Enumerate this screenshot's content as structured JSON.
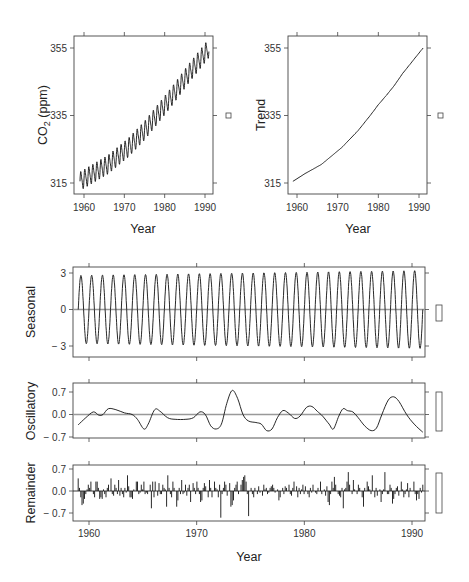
{
  "chart_data": [
    {
      "id": "co2",
      "type": "line",
      "title": "",
      "xlabel": "Year",
      "ylabel": "CO2 (ppm)",
      "ylabel_main": "CO",
      "ylabel_sub": "2",
      "ylabel_rest": " (ppm)",
      "xlim": [
        1958.5,
        1992
      ],
      "ylim": [
        313,
        358
      ],
      "xticks": [
        1960,
        1970,
        1980,
        1990
      ],
      "xtick_labels": [
        "1960",
        "1970",
        "1980",
        "1990"
      ],
      "yticks": [
        315,
        335,
        355
      ],
      "ytick_labels": [
        "315",
        "335",
        "355"
      ],
      "grid": false,
      "series": [
        {
          "name": "Monthly CO2",
          "x_start": 1959.0,
          "x_end": 1991.0,
          "seasonal_amplitude": 3.0,
          "trend_points": [
            [
              1959,
              315.5
            ],
            [
              1966,
              320.5
            ],
            [
              1971,
              325.5
            ],
            [
              1975,
              330.5
            ],
            [
              1978,
              335
            ],
            [
              1982,
              341
            ],
            [
              1986,
              347.5
            ],
            [
              1991,
              355
            ]
          ]
        }
      ],
      "range_box": {
        "label": "square marker",
        "value_span": 0
      }
    },
    {
      "id": "trend",
      "type": "line",
      "xlabel": "Year",
      "ylabel": "Trend",
      "xlim": [
        1958.5,
        1992
      ],
      "ylim": [
        313,
        358
      ],
      "xticks": [
        1960,
        1970,
        1980,
        1990
      ],
      "xtick_labels": [
        "1960",
        "1970",
        "1980",
        "1990"
      ],
      "yticks": [
        315,
        335,
        355
      ],
      "ytick_labels": [
        "315",
        "335",
        "355"
      ],
      "grid": false,
      "series": [
        {
          "name": "Trend",
          "points": [
            [
              1959,
              315.5
            ],
            [
              1962,
              317.8
            ],
            [
              1966,
              320.5
            ],
            [
              1969,
              323.5
            ],
            [
              1971,
              325.5
            ],
            [
              1975,
              330.5
            ],
            [
              1978,
              335
            ],
            [
              1980,
              338.2
            ],
            [
              1982,
              341
            ],
            [
              1984,
              344
            ],
            [
              1986,
              347.5
            ],
            [
              1988,
              350.5
            ],
            [
              1991,
              355
            ]
          ]
        }
      ]
    },
    {
      "id": "seasonal",
      "type": "line",
      "xlabel": "",
      "ylabel": "Seasonal",
      "xlim": [
        1958.5,
        1991.5
      ],
      "ylim": [
        -3.6,
        3.6
      ],
      "xticks": [
        1960,
        1970,
        1980,
        1990
      ],
      "yticks": [
        -3,
        0,
        3
      ],
      "ytick_labels": [
        "-3",
        "0",
        "3"
      ],
      "grid": false,
      "zero_line": true,
      "series": [
        {
          "name": "Seasonal",
          "x_start": 1959.0,
          "x_end": 1991.0,
          "amplitude_start": 2.8,
          "amplitude_end": 3.2,
          "cycles_per_year": 1
        }
      ]
    },
    {
      "id": "oscillatory",
      "type": "line",
      "xlabel": "",
      "ylabel": "Oscillatory",
      "xlim": [
        1958.5,
        1991.5
      ],
      "ylim": [
        -0.8,
        1.0
      ],
      "xticks": [
        1960,
        1970,
        1980,
        1990
      ],
      "yticks": [
        -0.7,
        0.0,
        0.7
      ],
      "ytick_labels": [
        "-0.7",
        "0.0",
        "0.7"
      ],
      "grid": false,
      "zero_line": true,
      "series": [
        {
          "name": "Oscillatory",
          "points": [
            [
              1959.0,
              -0.32
            ],
            [
              1959.7,
              -0.1
            ],
            [
              1960.4,
              0.08
            ],
            [
              1960.9,
              -0.02
            ],
            [
              1961.3,
              0.0
            ],
            [
              1961.8,
              0.18
            ],
            [
              1962.5,
              0.15
            ],
            [
              1963.3,
              0.05
            ],
            [
              1964.0,
              0.0
            ],
            [
              1964.5,
              -0.15
            ],
            [
              1965.1,
              -0.45
            ],
            [
              1965.5,
              -0.3
            ],
            [
              1966.1,
              0.15
            ],
            [
              1966.6,
              0.1
            ],
            [
              1967.3,
              -0.1
            ],
            [
              1968.0,
              -0.15
            ],
            [
              1969.0,
              -0.15
            ],
            [
              1969.7,
              -0.1
            ],
            [
              1970.3,
              0.08
            ],
            [
              1970.8,
              0.0
            ],
            [
              1971.3,
              -0.35
            ],
            [
              1971.8,
              -0.45
            ],
            [
              1972.3,
              -0.3
            ],
            [
              1972.8,
              0.35
            ],
            [
              1973.3,
              0.75
            ],
            [
              1973.8,
              0.5
            ],
            [
              1974.3,
              0.0
            ],
            [
              1974.8,
              -0.2
            ],
            [
              1975.5,
              -0.25
            ],
            [
              1976.0,
              -0.3
            ],
            [
              1976.5,
              -0.5
            ],
            [
              1977.0,
              -0.45
            ],
            [
              1977.5,
              -0.1
            ],
            [
              1978.0,
              0.12
            ],
            [
              1978.5,
              0.05
            ],
            [
              1979.1,
              -0.12
            ],
            [
              1979.6,
              -0.05
            ],
            [
              1980.2,
              0.22
            ],
            [
              1980.7,
              0.25
            ],
            [
              1981.2,
              0.1
            ],
            [
              1981.7,
              -0.05
            ],
            [
              1982.3,
              -0.3
            ],
            [
              1982.7,
              -0.45
            ],
            [
              1983.2,
              -0.05
            ],
            [
              1983.6,
              0.18
            ],
            [
              1984.0,
              0.12
            ],
            [
              1984.5,
              0.08
            ],
            [
              1985.0,
              -0.1
            ],
            [
              1985.6,
              -0.35
            ],
            [
              1986.2,
              -0.5
            ],
            [
              1986.7,
              -0.42
            ],
            [
              1987.2,
              0.0
            ],
            [
              1987.8,
              0.45
            ],
            [
              1988.3,
              0.55
            ],
            [
              1988.8,
              0.4
            ],
            [
              1989.5,
              0.0
            ],
            [
              1990.2,
              -0.3
            ],
            [
              1991.0,
              -0.55
            ]
          ]
        }
      ]
    },
    {
      "id": "remainder",
      "type": "bar",
      "xlabel": "Year",
      "ylabel": "Remainder",
      "xlim": [
        1958.5,
        1991.5
      ],
      "ylim": [
        -0.95,
        0.85
      ],
      "xticks": [
        1960,
        1970,
        1980,
        1990
      ],
      "xtick_labels": [
        "1960",
        "1970",
        "1980",
        "1990"
      ],
      "yticks": [
        -0.7,
        0.0,
        0.7
      ],
      "ytick_labels": [
        "-0.7",
        "0.0",
        "0.7"
      ],
      "grid": false,
      "zero_line": true,
      "series": [
        {
          "name": "Remainder",
          "x_start": 1959.0,
          "x_end": 1991.0,
          "step": 0.0833,
          "values": [
            0.4,
            0.1,
            -0.2,
            -0.45,
            -0.4,
            -0.25,
            -0.1,
            0.05,
            0.2,
            0.1,
            0.3,
            0.0,
            -0.1,
            -0.2,
            0.3,
            0.3,
            0.1,
            -0.25,
            -0.2,
            -0.25,
            0.05,
            -0.1,
            -0.2,
            0.1,
            0.2,
            0.0,
            0.4,
            -0.1,
            -0.15,
            0.2,
            0.1,
            -0.1,
            0.35,
            -0.15,
            0.1,
            -0.1,
            -0.2,
            0.1,
            -0.05,
            0.5,
            0.15,
            -0.2,
            -0.2,
            -0.25,
            0.05,
            0.0,
            0.3,
            0.3,
            -0.1,
            -0.05,
            0.2,
            0.05,
            0.3,
            -0.1,
            -0.05,
            -0.1,
            0.0,
            0.2,
            -0.55,
            0.3,
            -0.2,
            0.3,
            0.0,
            -0.15,
            0.25,
            -0.1,
            -0.1,
            0.2,
            0.1,
            0.05,
            -0.5,
            0.5,
            0.1,
            -0.1,
            -0.2,
            0.3,
            0.1,
            0.0,
            -0.5,
            -0.3,
            0.1,
            -0.1,
            0.35,
            -0.1,
            -0.05,
            0.2,
            -0.15,
            0.1,
            0.2,
            -0.35,
            0.0,
            0.25,
            0.1,
            -0.1,
            0.3,
            0.1,
            -0.1,
            -0.35,
            -0.3,
            0.1,
            0.25,
            0.15,
            0.0,
            -0.2,
            0.35,
            0.1,
            -0.2,
            0.0,
            0.3,
            0.1,
            0.05,
            -0.2,
            0.2,
            -0.85,
            -0.1,
            0.1,
            0.3,
            0.2,
            -0.15,
            0.0,
            0.25,
            -0.5,
            -0.45,
            -0.3,
            0.1,
            0.2,
            0.3,
            -0.1,
            0.0,
            0.2,
            0.35,
            0.45,
            0.5,
            0.3,
            -0.1,
            -0.8,
            0.0,
            0.1,
            -0.1,
            -0.2,
            0.1,
            0.0,
            -0.1,
            0.15,
            -0.05,
            0.0,
            -0.15,
            0.2,
            0.05,
            0.1,
            -0.1,
            -0.05,
            0.1,
            0.15,
            0.2,
            0.1,
            -0.05,
            0.0,
            0.05,
            -0.3,
            -0.2,
            0.0,
            0.1,
            -0.1,
            0.15,
            0.1,
            0.0,
            0.2,
            -0.1,
            -0.15,
            0.1,
            0.3,
            0.0,
            0.15,
            -0.2,
            0.1,
            -0.1,
            0.05,
            0.2,
            -0.1,
            0.15,
            0.0,
            -0.1,
            -0.2,
            0.1,
            -0.05,
            0.2,
            0.0,
            -0.05,
            -0.1,
            0.1,
            0.0,
            0.3,
            -0.1,
            0.0,
            0.05,
            -0.15,
            0.15,
            -0.35,
            -0.45,
            -0.1,
            0.3,
            0.1,
            0.45,
            0.2,
            0.0,
            -0.1,
            -0.15,
            -0.2,
            0.1,
            -0.55,
            0.05,
            0.1,
            0.3,
            0.6,
            0.2,
            0.0,
            -0.1,
            0.35,
            0.05,
            0.0,
            -0.1,
            0.2,
            0.1,
            0.0,
            -0.2,
            -0.5,
            0.1,
            0.0,
            0.3,
            0.15,
            0.05,
            -0.1,
            0.5,
            0.0,
            -0.2,
            0.1,
            -0.15,
            0.0,
            0.05,
            -0.35,
            -0.1,
            0.05,
            0.6,
            0.0,
            -0.1,
            -0.1,
            0.2,
            0.1,
            -0.4,
            -0.25,
            -0.1,
            0.1,
            0.15,
            -0.15,
            0.0,
            0.3,
            0.05,
            -0.2,
            -0.1,
            0.05,
            0.25,
            -0.2,
            0.1,
            0.0,
            0.0,
            0.3,
            -0.1,
            -0.3,
            -0.1,
            -0.25,
            0.1,
            -0.05,
            0.2
          ]
        }
      ]
    }
  ],
  "labels": {
    "co2_ylabel": "CO",
    "co2_ylabel_sub": "2",
    "co2_ylabel_rest": " (ppm)",
    "trend_ylabel": "Trend",
    "seasonal_ylabel": "Seasonal",
    "osc_ylabel": "Oscillatory",
    "rem_ylabel": "Remainder",
    "xlabel_top_left": "Year",
    "xlabel_top_right": "Year",
    "xlabel_bottom": "Year"
  }
}
